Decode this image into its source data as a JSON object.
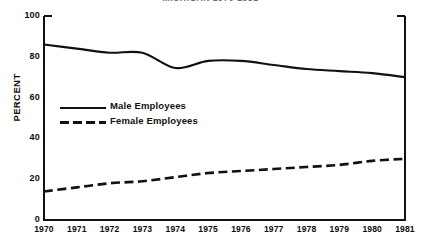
{
  "title": "MICHIGAN 1970-1981",
  "axis": {
    "ylabel": "PERCENT",
    "yticks": [
      "100",
      "80",
      "60",
      "40",
      "20",
      "0"
    ],
    "xticks": [
      "1970",
      "1971",
      "1972",
      "1973",
      "1974",
      "1975",
      "1976",
      "1977",
      "1978",
      "1979",
      "1980",
      "1981"
    ]
  },
  "legend": {
    "items": [
      {
        "label": "Male Employees",
        "style": "solid"
      },
      {
        "label": "Female Employees",
        "style": "dashed"
      }
    ]
  },
  "colors": {
    "line": "#111111",
    "frame": "#111111",
    "text": "#0d0d0d",
    "background": "#ffffff"
  },
  "chart_data": {
    "type": "line",
    "title": "MICHIGAN 1970-1981",
    "xlabel": "",
    "ylabel": "PERCENT",
    "ylim": [
      0,
      100
    ],
    "xlim": [
      1970,
      1981
    ],
    "grid": false,
    "legend_position": "inside-left",
    "x": [
      1970,
      1971,
      1972,
      1973,
      1974,
      1975,
      1976,
      1977,
      1978,
      1979,
      1980,
      1981
    ],
    "series": [
      {
        "name": "Male Employees",
        "style": "solid",
        "values": [
          86,
          84,
          82,
          82,
          74.5,
          78,
          78,
          76,
          74,
          73,
          72,
          70
        ]
      },
      {
        "name": "Female Employees",
        "style": "dashed",
        "values": [
          14,
          16,
          18,
          19,
          21,
          23,
          24,
          25,
          26,
          27,
          29,
          30
        ]
      }
    ]
  }
}
